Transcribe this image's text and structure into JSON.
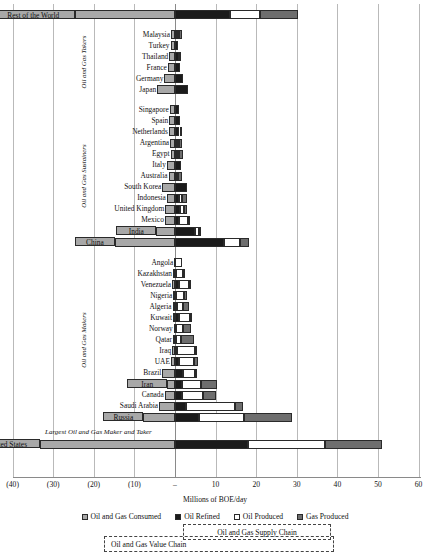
{
  "chart_data": {
    "type": "bar",
    "orientation": "horizontal",
    "title": "",
    "xlabel": "Millions of BOE/day",
    "ylabel": "",
    "xlim": [
      -40,
      60
    ],
    "xticks": [
      -40,
      -30,
      -20,
      -10,
      0,
      10,
      20,
      30,
      40,
      50,
      60
    ],
    "xticklabels": [
      "(40)",
      "(30)",
      "(20)",
      "(10)",
      "–",
      "10",
      "20",
      "30",
      "40",
      "50",
      "60"
    ],
    "grid": true,
    "legend_position": "bottom",
    "stacked": true,
    "series": [
      {
        "name": "Oil and Gas Consumed",
        "color": "#a8a8a8",
        "direction": "negative"
      },
      {
        "name": "Oil Refined",
        "color": "#1b1b1b",
        "direction": "positive"
      },
      {
        "name": "Oil Produced",
        "color": "#ffffff",
        "direction": "positive"
      },
      {
        "name": "Gas Produced",
        "color": "#6e6e6e",
        "direction": "positive"
      }
    ],
    "categories": [
      "Rest of the World",
      "Malaysia",
      "Turkey",
      "Thailand",
      "France",
      "Germany",
      "Japan",
      "Singapore",
      "Spain",
      "Netherlands",
      "Argentina",
      "Egypt",
      "Italy",
      "Australia",
      "South Korea",
      "Indonesia",
      "United Kingdom",
      "Mexico",
      "India",
      "China",
      "Angola",
      "Kazakhstan",
      "Venezuela",
      "Nigeria",
      "Algeria",
      "Kuwait",
      "Norway",
      "Qatar",
      "Iraq",
      "UAE",
      "Brazil",
      "Iran",
      "Canada",
      "Saudi Arabia",
      "Russia",
      "United States"
    ],
    "rows": [
      {
        "label": "Rest of the World",
        "consumed": -24.7,
        "refined": 13.6,
        "oil_produced": 7.4,
        "gas_produced": 9.4,
        "highlight": true,
        "group": "header"
      },
      {
        "label": "Malaysia",
        "consumed": -1.0,
        "refined": 0.5,
        "oil_produced": 0.4,
        "gas_produced": 0.9,
        "group": "takers"
      },
      {
        "label": "Turkey",
        "consumed": -1.1,
        "refined": 0.8,
        "oil_produced": 0.1,
        "gas_produced": 0.0,
        "group": "takers"
      },
      {
        "label": "Thailand",
        "consumed": -1.4,
        "refined": 0.9,
        "oil_produced": 0.3,
        "gas_produced": 0.1,
        "group": "takers"
      },
      {
        "label": "France",
        "consumed": -1.8,
        "refined": 1.3,
        "oil_produced": 0.1,
        "gas_produced": 0.0,
        "group": "takers"
      },
      {
        "label": "Germany",
        "consumed": -2.6,
        "refined": 1.9,
        "oil_produced": 0.1,
        "gas_produced": 0.1,
        "group": "takers"
      },
      {
        "label": "Japan",
        "consumed": -4.4,
        "refined": 3.2,
        "oil_produced": 0.0,
        "gas_produced": 0.1,
        "group": "takers"
      },
      {
        "label": "Singapore",
        "consumed": -1.3,
        "refined": 1.0,
        "oil_produced": 0.0,
        "gas_produced": 0.0,
        "group": "sustainers"
      },
      {
        "label": "Spain",
        "consumed": -1.4,
        "refined": 1.2,
        "oil_produced": 0.0,
        "gas_produced": 0.0,
        "group": "sustainers"
      },
      {
        "label": "Netherlands",
        "consumed": -1.5,
        "refined": 1.1,
        "oil_produced": 0.1,
        "gas_produced": 0.2,
        "group": "sustainers"
      },
      {
        "label": "Argentina",
        "consumed": -1.2,
        "refined": 0.6,
        "oil_produced": 0.5,
        "gas_produced": 0.6,
        "group": "sustainers"
      },
      {
        "label": "Egypt",
        "consumed": -1.1,
        "refined": 0.5,
        "oil_produced": 0.6,
        "gas_produced": 0.8,
        "group": "sustainers"
      },
      {
        "label": "Italy",
        "consumed": -2.0,
        "refined": 1.6,
        "oil_produced": 0.1,
        "gas_produced": 0.1,
        "group": "sustainers"
      },
      {
        "label": "Australia",
        "consumed": -1.6,
        "refined": 0.5,
        "oil_produced": 0.3,
        "gas_produced": 1.0,
        "group": "sustainers"
      },
      {
        "label": "South Korea",
        "consumed": -3.1,
        "refined": 2.9,
        "oil_produced": 0.0,
        "gas_produced": 0.1,
        "group": "sustainers"
      },
      {
        "label": "Indonesia",
        "consumed": -2.0,
        "refined": 1.0,
        "oil_produced": 0.8,
        "gas_produced": 1.2,
        "group": "sustainers"
      },
      {
        "label": "United Kingdom",
        "consumed": -2.4,
        "refined": 1.2,
        "oil_produced": 1.0,
        "gas_produced": 0.7,
        "group": "sustainers"
      },
      {
        "label": "Mexico",
        "consumed": -2.5,
        "refined": 1.0,
        "oil_produced": 2.2,
        "gas_produced": 0.4,
        "group": "sustainers"
      },
      {
        "label": "India",
        "consumed": -4.6,
        "refined": 4.9,
        "oil_produced": 0.9,
        "gas_produced": 0.3,
        "highlight": true,
        "group": "sustainers"
      },
      {
        "label": "China",
        "consumed": -14.8,
        "refined": 12.1,
        "oil_produced": 4.0,
        "gas_produced": 2.2,
        "highlight": true,
        "group": "sustainers"
      },
      {
        "label": "Angola",
        "consumed": -0.2,
        "refined": 0.1,
        "oil_produced": 1.6,
        "gas_produced": 0.1,
        "group": "makers"
      },
      {
        "label": "Kazakhstan",
        "consumed": -0.5,
        "refined": 0.3,
        "oil_produced": 1.7,
        "gas_produced": 0.4,
        "group": "makers"
      },
      {
        "label": "Venezuela",
        "consumed": -0.7,
        "refined": 1.1,
        "oil_produced": 2.3,
        "gas_produced": 0.2,
        "group": "makers"
      },
      {
        "label": "Nigeria",
        "consumed": -0.4,
        "refined": 0.2,
        "oil_produced": 1.9,
        "gas_produced": 0.8,
        "group": "makers"
      },
      {
        "label": "Algeria",
        "consumed": -0.6,
        "refined": 0.5,
        "oil_produced": 1.4,
        "gas_produced": 1.5,
        "group": "makers"
      },
      {
        "label": "Kuwait",
        "consumed": -0.5,
        "refined": 0.9,
        "oil_produced": 2.9,
        "gas_produced": 0.3,
        "group": "makers"
      },
      {
        "label": "Norway",
        "consumed": -0.3,
        "refined": 0.3,
        "oil_produced": 1.6,
        "gas_produced": 2.0,
        "group": "makers"
      },
      {
        "label": "Qatar",
        "consumed": -0.5,
        "refined": 0.2,
        "oil_produced": 1.3,
        "gas_produced": 3.1,
        "group": "makers"
      },
      {
        "label": "Iraq",
        "consumed": -0.7,
        "refined": 0.6,
        "oil_produced": 4.4,
        "gas_produced": 0.2,
        "group": "makers"
      },
      {
        "label": "UAE",
        "consumed": -1.0,
        "refined": 0.9,
        "oil_produced": 3.7,
        "gas_produced": 1.0,
        "group": "makers"
      },
      {
        "label": "Brazil",
        "consumed": -3.1,
        "refined": 1.9,
        "oil_produced": 3.0,
        "gas_produced": 0.4,
        "group": "makers"
      },
      {
        "label": "Iran",
        "consumed": -1.9,
        "refined": 1.8,
        "oil_produced": 4.6,
        "gas_produced": 4.0,
        "highlight": true,
        "group": "makers"
      },
      {
        "label": "Canada",
        "consumed": -2.5,
        "refined": 1.8,
        "oil_produced": 5.2,
        "gas_produced": 3.0,
        "group": "makers"
      },
      {
        "label": "Saudi Arabia",
        "consumed": -3.9,
        "refined": 2.7,
        "oil_produced": 12.2,
        "gas_produced": 1.9,
        "group": "makers"
      },
      {
        "label": "Russia",
        "consumed": -7.8,
        "refined": 5.8,
        "oil_produced": 11.3,
        "gas_produced": 11.7,
        "highlight": true,
        "group": "makers"
      },
      {
        "label": "United States",
        "consumed": -33.3,
        "refined": 18.0,
        "oil_produced": 19.0,
        "gas_produced": 14.0,
        "highlight": true,
        "group": "largest"
      }
    ],
    "group_labels": [
      {
        "text": "Oil and Gas Takers",
        "group": "takers"
      },
      {
        "text": "Oil and Gas Sustainers",
        "group": "sustainers"
      },
      {
        "text": "Oil and Gas Makers",
        "group": "makers"
      }
    ],
    "annotations": [
      {
        "text": "Largest Oil and Gas Maker and Taker",
        "kind": "note"
      },
      {
        "text": "Oil and Gas Supply Chain",
        "kind": "bracket"
      },
      {
        "text": "Oil and Gas Value Chain",
        "kind": "bracket"
      }
    ],
    "legend": [
      {
        "label": "Oil and Gas Consumed",
        "swatch": "sw-consumed"
      },
      {
        "label": "Oil Refined",
        "swatch": "sw-refined"
      },
      {
        "label": "Oil Produced",
        "swatch": "sw-oilprod"
      },
      {
        "label": "Gas Produced",
        "swatch": "sw-gasprod"
      }
    ]
  },
  "axis": {
    "title": "Millions of BOE/day"
  },
  "colors": {
    "consumed": "#a8a8a8",
    "refined": "#1b1b1b",
    "oil_produced": "#ffffff",
    "gas_produced": "#6e6e6e",
    "grid": "#b9b9b9"
  }
}
